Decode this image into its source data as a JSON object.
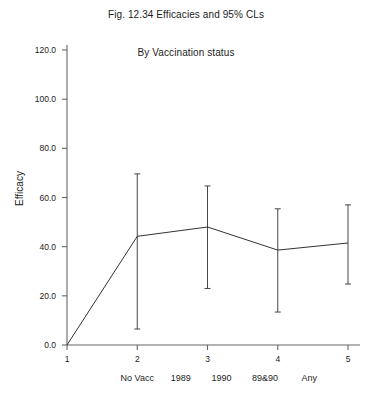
{
  "chart_data": {
    "type": "line",
    "title": "Fig. 12.34 Efficacies and 95% CLs",
    "subtitle": "By Vaccination status",
    "xlabel": "",
    "ylabel": "Efficacy",
    "ylim": [
      0,
      120
    ],
    "xlim": [
      1,
      5
    ],
    "grid": false,
    "legend": "none",
    "ytick_labels": [
      "0.0",
      "20.0",
      "40.0",
      "60.0",
      "80.0",
      "100.0",
      "120.0"
    ],
    "ytick_values": [
      0,
      20,
      40,
      60,
      80,
      100,
      120
    ],
    "xtick_labels": [
      "1",
      "2",
      "3",
      "4",
      "5"
    ],
    "xtick_values": [
      1,
      2,
      3,
      4,
      5
    ],
    "group_labels": [
      "No Vacc",
      "1989",
      "1990",
      "89&90",
      "Any"
    ],
    "group_label_x": [
      2.0,
      2.62,
      3.2,
      3.82,
      4.45
    ],
    "x": [
      1,
      2,
      3,
      4,
      5
    ],
    "values": [
      0.0,
      44.2,
      48.0,
      38.6,
      41.5
    ],
    "error_low": [
      null,
      6.5,
      23.0,
      13.4,
      24.8
    ],
    "error_high": [
      null,
      69.6,
      64.7,
      55.4,
      57.0
    ],
    "series": [
      {
        "name": "Efficacy",
        "values": [
          0.0,
          44.2,
          48.0,
          38.6,
          41.5
        ],
        "ci_lower": [
          null,
          6.5,
          23.0,
          13.4,
          24.8
        ],
        "ci_upper": [
          null,
          69.6,
          64.7,
          55.4,
          57.0
        ]
      }
    ],
    "line_color": "#333333",
    "axis_color": "#666666"
  },
  "axis": {
    "y_label": "Efficacy"
  }
}
